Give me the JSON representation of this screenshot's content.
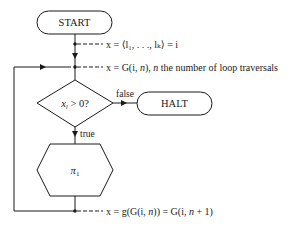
{
  "nodes": {
    "start": {
      "label": "START",
      "shape": "terminal"
    },
    "decision": {
      "label_var": "x",
      "label_sub": "l",
      "label_rest": " > 0?",
      "shape": "diamond"
    },
    "halt": {
      "label": "HALT",
      "shape": "terminal"
    },
    "process": {
      "label_var": "π",
      "label_sub": "1",
      "shape": "hexagon"
    }
  },
  "edges": {
    "false_label": "false",
    "true_label": "true"
  },
  "annotations": {
    "a1": {
      "text": "x = ⟨l₁, . . ., lₖ⟩ = i"
    },
    "a2_prefix": "x = G(i, ",
    "a2_n": "n",
    "a2_mid": "), ",
    "a2_n2": "n",
    "a2_suffix": " the number of loop traversals",
    "a3_prefix": "x = g(G(i, ",
    "a3_n": "n",
    "a3_mid": ")) = G(i, ",
    "a3_n2": "n",
    "a3_suffix": " + 1)"
  },
  "colors": {
    "stroke": "#1a1a1a",
    "background": "#ffffff"
  }
}
